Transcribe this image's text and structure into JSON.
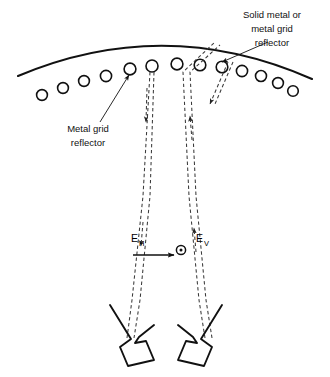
{
  "diagram": {
    "colors": {
      "stroke": "#111111",
      "background": "#ffffff",
      "dash": "#3a3a3a"
    },
    "labels": {
      "solid_reflector": {
        "line1": "Solid metal or",
        "line2": "metal grid",
        "line3": "reflector"
      },
      "grid_reflector": {
        "line1": "Metal grid",
        "line2": "reflector"
      },
      "e_horizontal": {
        "base": "E",
        "subscript": "H"
      },
      "e_vertical": {
        "base": "E",
        "subscript": "V"
      }
    },
    "elements": {
      "main_reflector_name": "solid-metal-reflector-arc",
      "grid_reflector_name": "metal-grid-circle-row",
      "grid_circle_count": 15,
      "feed_count": 2,
      "polarization_symbol": "circle-dot-out-of-page"
    }
  }
}
